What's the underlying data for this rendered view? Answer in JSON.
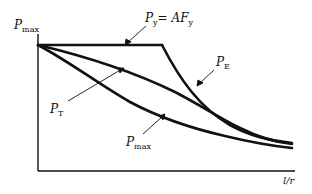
{
  "diagram": {
    "type": "column-strength-curves",
    "y_axis": {
      "label_main": "P",
      "label_sub": "max"
    },
    "x_axis": {
      "label": "l/r"
    },
    "curves": [
      {
        "id": "yield",
        "label_main": "P",
        "label_sub": "y",
        "label_eq": "= AF",
        "label_eq_sub": "y",
        "description": "Horizontal yield plateau"
      },
      {
        "id": "euler",
        "label_main": "P",
        "label_sub": "E",
        "description": "Euler buckling curve"
      },
      {
        "id": "tangent",
        "label_main": "P",
        "label_sub": "T",
        "description": "Tangent modulus curve"
      },
      {
        "id": "max",
        "label_main": "P",
        "label_sub": "max",
        "description": "Maximum load curve"
      }
    ],
    "colors": {
      "line": "#111111",
      "background": "#ffffff"
    }
  }
}
